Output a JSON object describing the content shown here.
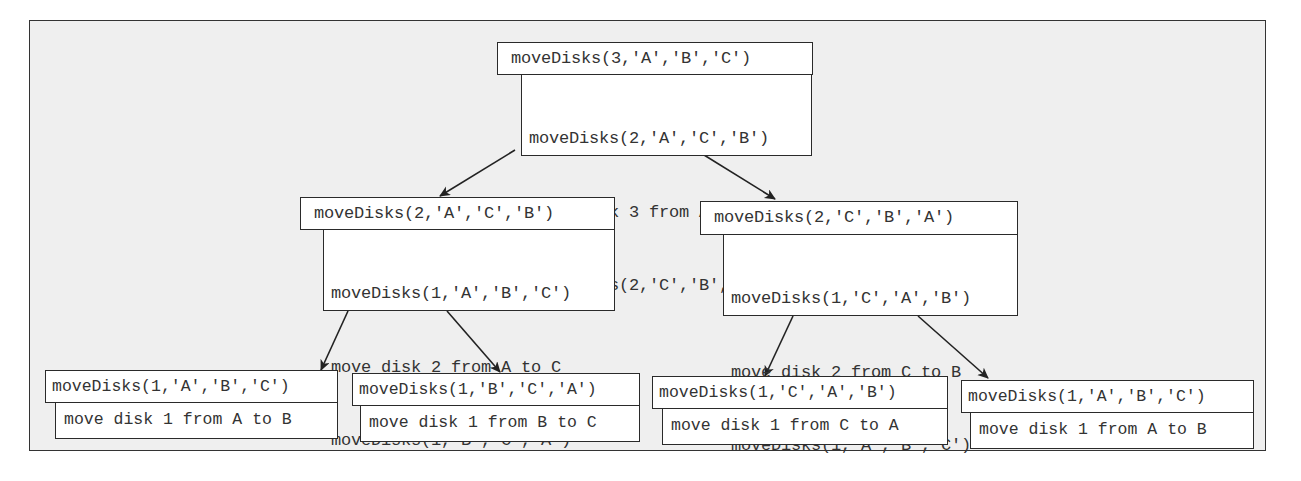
{
  "diagram": {
    "type": "recursion-tree",
    "root": {
      "call": "moveDisks(3,'A','B','C')",
      "steps": [
        "moveDisks(2,'A','C','B')",
        "move disk 3 from A to B",
        "moveDisks(2,'C','B','A')"
      ]
    },
    "level2": [
      {
        "call": "moveDisks(2,'A','C','B')",
        "steps": [
          "moveDisks(1,'A','B','C')",
          "move disk 2 from A to C",
          "moveDisks(1,'B','C','A')"
        ]
      },
      {
        "call": "moveDisks(2,'C','B','A')",
        "steps": [
          "moveDisks(1,'C','A','B')",
          "move disk 2 from C to B",
          "moveDisks(1,'A','B','C')"
        ]
      }
    ],
    "leaves": [
      {
        "call": "moveDisks(1,'A','B','C')",
        "step": "move disk 1 from A to B"
      },
      {
        "call": "moveDisks(1,'B','C','A')",
        "step": "move disk 1 from B to C"
      },
      {
        "call": "moveDisks(1,'C','A','B')",
        "step": "move disk 1 from C to A"
      },
      {
        "call": "moveDisks(1,'A','B','C')",
        "step": "move disk 1 from A to B"
      }
    ],
    "edges": [
      {
        "from": "root",
        "to": "level2.0"
      },
      {
        "from": "root",
        "to": "level2.1"
      },
      {
        "from": "level2.0",
        "to": "leaves.0"
      },
      {
        "from": "level2.0",
        "to": "leaves.1"
      },
      {
        "from": "level2.1",
        "to": "leaves.2"
      },
      {
        "from": "level2.1",
        "to": "leaves.3"
      }
    ],
    "colors": {
      "background": "#efefef",
      "box": "#ffffff",
      "stroke": "#2a2a2a",
      "text": "#333333"
    }
  }
}
